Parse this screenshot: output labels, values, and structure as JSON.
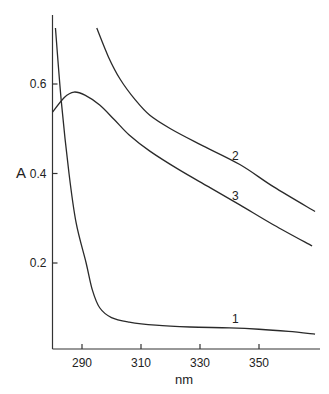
{
  "chart_data": {
    "type": "line",
    "title": "",
    "xlabel": "nm",
    "ylabel": "A",
    "xlim": [
      280,
      371
    ],
    "ylim": [
      0,
      0.75
    ],
    "x_ticks": [
      290,
      310,
      330,
      350
    ],
    "x_tick_labels": [
      "290",
      "310",
      "330",
      "350"
    ],
    "y_ticks": [
      0.2,
      0.4,
      0.6
    ],
    "y_tick_labels": [
      "0.2",
      "0.4",
      "0.6"
    ],
    "grid": false,
    "legend": "inline curve labels",
    "series": [
      {
        "name": "1",
        "x": [
          281,
          283,
          285.6,
          288,
          291.4,
          293.5,
          296,
          300,
          306,
          315,
          326.6,
          340,
          350,
          360,
          369
        ],
        "y": [
          0.725,
          0.56,
          0.4,
          0.29,
          0.2,
          0.14,
          0.1,
          0.078,
          0.068,
          0.061,
          0.057,
          0.055,
          0.052,
          0.047,
          0.041
        ]
      },
      {
        "name": "2",
        "x": [
          295,
          299,
          303,
          308,
          313,
          320,
          330,
          343.5,
          355,
          369
        ],
        "y": [
          0.725,
          0.66,
          0.61,
          0.565,
          0.53,
          0.5,
          0.465,
          0.42,
          0.37,
          0.315
        ]
      },
      {
        "name": "3",
        "x": [
          280,
          284,
          287.3,
          291,
          296,
          301,
          306,
          313,
          323,
          333,
          343.5,
          355,
          368
        ],
        "y": [
          0.537,
          0.57,
          0.582,
          0.575,
          0.553,
          0.52,
          0.486,
          0.45,
          0.408,
          0.37,
          0.33,
          0.285,
          0.238
        ]
      }
    ],
    "annotations": [
      {
        "text": "1",
        "x": 342,
        "y": 0.065
      },
      {
        "text": "2",
        "x": 342,
        "y": 0.43
      },
      {
        "text": "3",
        "x": 342,
        "y": 0.34
      }
    ]
  }
}
